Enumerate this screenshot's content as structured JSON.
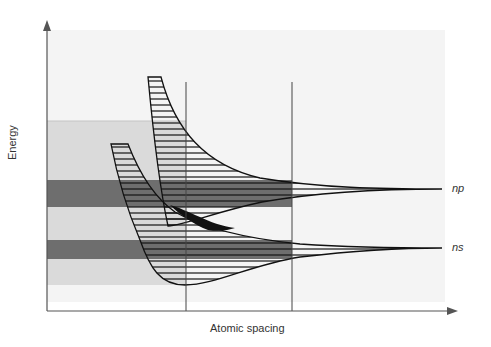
{
  "diagram": {
    "title": "",
    "axes": {
      "y_label": "Energy",
      "x_label": "Atomic spacing"
    },
    "levels": [
      {
        "name": "np",
        "label": "np"
      },
      {
        "name": "ns",
        "label": "ns"
      }
    ],
    "colors": {
      "background_region": "#f3f3f3",
      "light_band_region": "#d9d9d9",
      "dark_band": "#6e6e6e",
      "overlap_fill": "#111111",
      "lines": "#222222",
      "axis": "#555555"
    }
  }
}
